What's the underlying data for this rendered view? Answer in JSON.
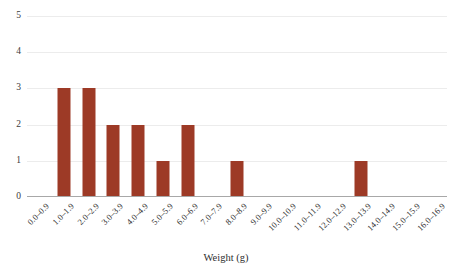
{
  "chart_data": {
    "type": "bar",
    "title": "",
    "subtitle": "",
    "xlabel": "Weight (g)",
    "ylabel": "",
    "categories": [
      "0.0–0.9",
      "1.0–1.9",
      "2.0–2.9",
      "3.0–3.9",
      "4.0–4.9",
      "5.0–5.9",
      "6.0–6.9",
      "7.0–7.9",
      "8.0–8.9",
      "9.0–9.9",
      "10.0–10.9",
      "11.0–11.9",
      "12.0–12.9",
      "13.0–13.9",
      "14.0–14.9",
      "15.0–15.9",
      "16.0–16.9"
    ],
    "values": [
      0,
      3,
      3,
      2,
      2,
      1,
      2,
      0,
      1,
      0,
      0,
      0,
      0,
      1,
      0,
      0,
      0
    ],
    "yticks": [
      "0",
      "1",
      "2",
      "3",
      "4",
      "5"
    ],
    "ylim": [
      0,
      5
    ],
    "grid": true,
    "legend": false,
    "legend_position": "none",
    "bar_color": "#9d3a26",
    "gridline_color": "#ececec",
    "axis_color": "#a8a8a8",
    "background_color": "#ffffff"
  }
}
